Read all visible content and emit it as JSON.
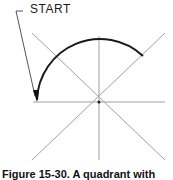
{
  "figure": {
    "start_label": "START",
    "caption": "Figure 15-30. A quadrant with",
    "colors": {
      "guide_lines": "#9a9a9a",
      "arc": "#1a1a1a",
      "leader": "#555555",
      "text": "#1a1a1a"
    },
    "center": [
      99,
      102
    ],
    "arc": {
      "radius": 63,
      "start_point": [
        37,
        102
      ],
      "end_point": [
        142,
        56
      ],
      "sweep": "clockwise from left through top to 45°"
    }
  }
}
